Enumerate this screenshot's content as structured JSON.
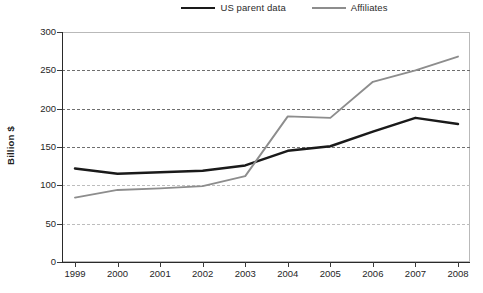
{
  "chart_data": {
    "type": "line",
    "title": "",
    "xlabel": "",
    "ylabel": "Billion $",
    "categories": [
      "1999",
      "2000",
      "2001",
      "2002",
      "2003",
      "2004",
      "2005",
      "2006",
      "2007",
      "2008"
    ],
    "x": [
      1999,
      2000,
      2001,
      2002,
      2003,
      2004,
      2005,
      2006,
      2007,
      2008
    ],
    "ylim": [
      0,
      300
    ],
    "yticks": [
      0,
      50,
      100,
      150,
      200,
      250,
      300
    ],
    "grid": true,
    "legend_position": "top-right",
    "series": [
      {
        "name": "US parent data",
        "color": "#1a1a1a",
        "values": [
          122,
          115,
          117,
          119,
          126,
          145,
          151,
          170,
          188,
          180
        ]
      },
      {
        "name": "Affiliates",
        "color": "#8d8d8d",
        "values": [
          84,
          94,
          96,
          99,
          112,
          190,
          188,
          235,
          250,
          268
        ]
      }
    ]
  },
  "legend": {
    "items": [
      {
        "label": "US parent data",
        "swatch": "line-swatch-dark"
      },
      {
        "label": "Affiliates",
        "swatch": "line-swatch-gray"
      }
    ]
  },
  "axes": {
    "y_title": "Billion $",
    "y_tick_labels": [
      "300",
      "250",
      "200",
      "150",
      "100",
      "50",
      "0"
    ],
    "x_tick_labels": [
      "1999",
      "2000",
      "2001",
      "2002",
      "2003",
      "2004",
      "2005",
      "2006",
      "2007",
      "2008"
    ]
  }
}
